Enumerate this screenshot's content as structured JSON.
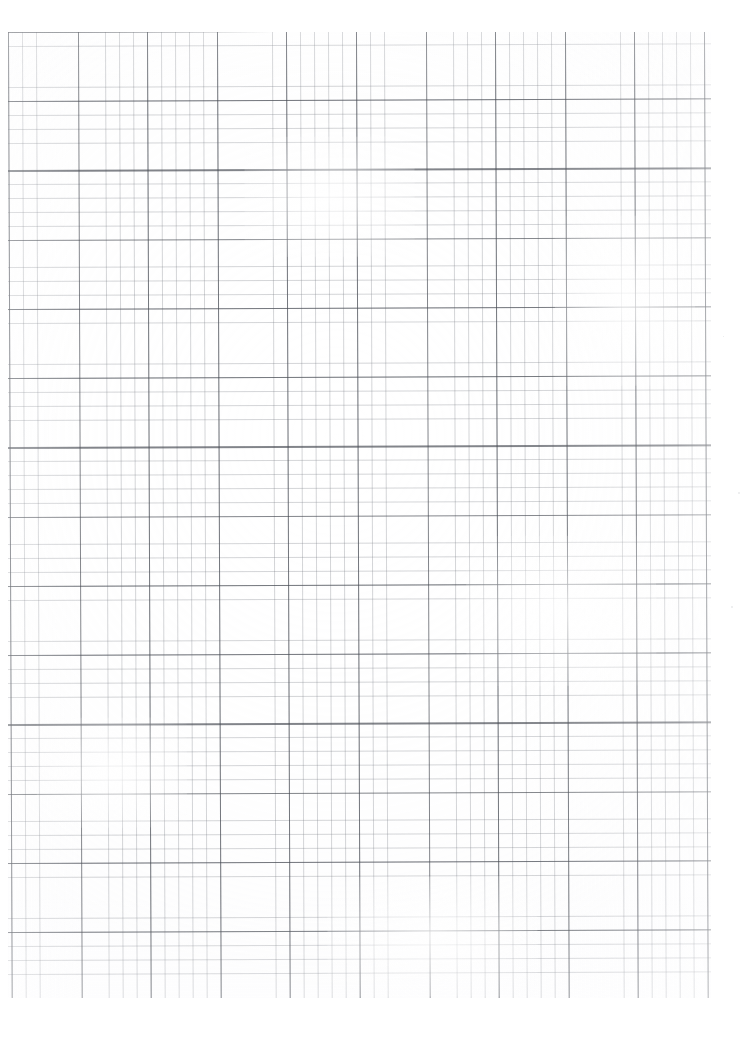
{
  "document": {
    "kind": "scanned-graph-paper",
    "title": "Blank Graph Paper Sheet",
    "page_width_px": 749,
    "page_height_px": 1052,
    "background_color": "#ffffff",
    "visible_text": "",
    "annotations": "none"
  },
  "grid": {
    "region": {
      "left_px": 8,
      "top_px": 32,
      "right_px": 711,
      "bottom_px": 998,
      "width_px": 703,
      "height_px": 966
    },
    "minor": {
      "label": "minor-gridline",
      "cell_width_px": 13.92,
      "cell_height_px": 13.85,
      "line_width_px": 0.7,
      "color": "#787c84",
      "opacity": 0.32,
      "columns": 50,
      "rows": 69
    },
    "major": {
      "label": "major-gridline",
      "every_n_cells": 5,
      "spacing_x_px": 69.6,
      "spacing_y_px": 69.25,
      "line_width_px": 1.05,
      "color": "#464a52",
      "opacity": 0.68,
      "columns": 10,
      "rows": 14
    },
    "skew_degrees": -0.22
  },
  "scan_artifacts": {
    "paper_tone_color": "#fafafb",
    "edge_fade": "right and bottom edges lighter",
    "faded_patches": 5,
    "stray_specks": 3
  },
  "chart_data": {
    "type": "table",
    "xlabel": "",
    "ylabel": "",
    "categories": [],
    "values": [],
    "series": [],
    "grid": true,
    "legend_position": "none",
    "annotations": [
      "No plotted data — the sheet is empty ruled graph paper."
    ]
  }
}
